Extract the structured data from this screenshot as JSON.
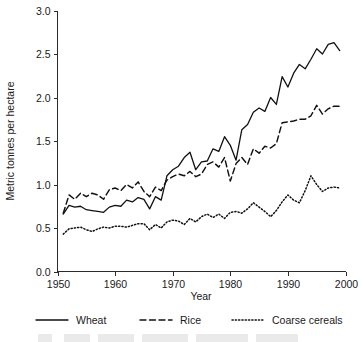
{
  "chart_data": {
    "type": "line",
    "title": "",
    "xlabel": "Year",
    "ylabel": "Metric tonnes per hectare",
    "xlim": [
      1950,
      2000
    ],
    "ylim": [
      0.0,
      3.0
    ],
    "xticks": [
      1950,
      1960,
      1970,
      1980,
      1990,
      2000
    ],
    "xtick_labels": [
      "1950",
      "1960",
      "1970",
      "1980",
      "1990",
      "2000"
    ],
    "yticks": [
      0.0,
      0.5,
      1.0,
      1.5,
      2.0,
      2.5,
      3.0
    ],
    "ytick_labels": [
      "0.0",
      "0.5",
      "1.0",
      "1.5",
      "2.0",
      "2.5",
      "3.0"
    ],
    "grid": false,
    "legend_position": "below-axes",
    "x": [
      1951,
      1952,
      1953,
      1954,
      1955,
      1956,
      1957,
      1958,
      1959,
      1960,
      1961,
      1962,
      1963,
      1964,
      1965,
      1966,
      1967,
      1968,
      1969,
      1970,
      1971,
      1972,
      1973,
      1974,
      1975,
      1976,
      1977,
      1978,
      1979,
      1980,
      1981,
      1982,
      1983,
      1984,
      1985,
      1986,
      1987,
      1988,
      1989,
      1990,
      1991,
      1992,
      1993,
      1994,
      1995,
      1996,
      1997,
      1998,
      1999
    ],
    "series": [
      {
        "name": "Wheat",
        "style": "solid",
        "values": [
          0.66,
          0.76,
          0.74,
          0.75,
          0.71,
          0.7,
          0.69,
          0.68,
          0.74,
          0.76,
          0.75,
          0.82,
          0.8,
          0.85,
          0.83,
          0.72,
          0.86,
          0.82,
          1.1,
          1.17,
          1.21,
          1.31,
          1.37,
          1.17,
          1.26,
          1.27,
          1.41,
          1.38,
          1.55,
          1.45,
          1.28,
          1.63,
          1.69,
          1.83,
          1.88,
          1.84,
          2.0,
          1.92,
          2.24,
          2.12,
          2.28,
          2.38,
          2.33,
          2.44,
          2.56,
          2.5,
          2.61,
          2.63,
          2.54
        ]
      },
      {
        "name": "Rice",
        "style": "dashed",
        "values": [
          0.67,
          0.88,
          0.83,
          0.9,
          0.86,
          0.9,
          0.88,
          0.83,
          0.94,
          0.96,
          0.93,
          1.0,
          0.96,
          1.03,
          0.92,
          0.86,
          0.97,
          0.93,
          1.05,
          1.09,
          1.12,
          1.1,
          1.15,
          1.09,
          1.12,
          1.23,
          1.26,
          1.2,
          1.31,
          1.04,
          1.24,
          1.31,
          1.23,
          1.41,
          1.36,
          1.44,
          1.42,
          1.47,
          1.71,
          1.72,
          1.73,
          1.75,
          1.75,
          1.79,
          1.91,
          1.81,
          1.87,
          1.9,
          1.9
        ]
      },
      {
        "name": "Coarse cereals",
        "style": "dotted",
        "values": [
          0.43,
          0.49,
          0.5,
          0.51,
          0.48,
          0.46,
          0.49,
          0.51,
          0.5,
          0.52,
          0.52,
          0.51,
          0.53,
          0.55,
          0.55,
          0.48,
          0.54,
          0.5,
          0.57,
          0.59,
          0.58,
          0.54,
          0.61,
          0.57,
          0.63,
          0.66,
          0.62,
          0.66,
          0.61,
          0.68,
          0.69,
          0.67,
          0.72,
          0.79,
          0.74,
          0.69,
          0.63,
          0.7,
          0.8,
          0.88,
          0.82,
          0.79,
          0.93,
          1.1,
          1.0,
          0.92,
          0.96,
          0.97,
          0.96
        ]
      }
    ]
  },
  "axes": {
    "y_axis_label": "Metric tonnes per hectare",
    "x_axis_label": "Year"
  },
  "legend": {
    "items": [
      {
        "label": "Wheat",
        "style": "solid"
      },
      {
        "label": "Rice",
        "style": "dashed"
      },
      {
        "label": "Coarse cereals",
        "style": "dotted"
      }
    ]
  }
}
